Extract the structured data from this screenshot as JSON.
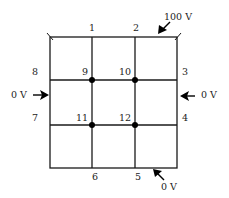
{
  "diagram": {
    "type": "finite-difference-grid",
    "grid": {
      "rows": 3,
      "cols": 3
    },
    "boundary_labels": {
      "n1": "1",
      "n2": "2",
      "n3": "3",
      "n4": "4",
      "n5": "5",
      "n6": "6",
      "n7": "7",
      "n8": "8"
    },
    "interior_labels": {
      "n9": "9",
      "n10": "10",
      "n11": "11",
      "n12": "12"
    },
    "potentials": {
      "top": "100 V",
      "left": "0 V",
      "right": "0 V",
      "bottom": "0 V"
    },
    "colors": {
      "line": "#1a1a1a",
      "node": "#000000",
      "text": "#222222"
    }
  }
}
